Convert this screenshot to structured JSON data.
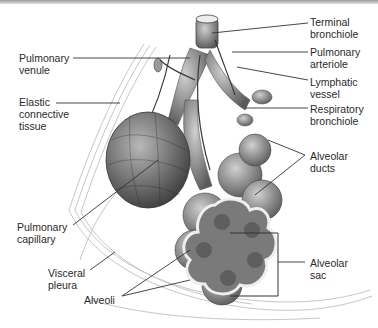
{
  "diagram": {
    "labels": [
      {
        "id": "terminal_bronchiole",
        "text": "Terminal\nbronchiole",
        "side": "right"
      },
      {
        "id": "pulmonary_arteriole",
        "text": "Pulmonary\narteriole",
        "side": "right"
      },
      {
        "id": "lymphatic_vessel",
        "text": "Lymphatic\nvessel",
        "side": "right"
      },
      {
        "id": "respiratory_bronchiole",
        "text": "Respiratory\nbronchiole",
        "side": "right"
      },
      {
        "id": "alveolar_ducts",
        "text": "Alveolar\nducts",
        "side": "right"
      },
      {
        "id": "alveolar_sac",
        "text": "Alveolar\nsac",
        "side": "right"
      },
      {
        "id": "pulmonary_venule",
        "text": "Pulmonary\nvenule",
        "side": "left"
      },
      {
        "id": "elastic_connective_tissue",
        "text": "Elastic\nconnective\ntissue",
        "side": "left"
      },
      {
        "id": "pulmonary_capillary",
        "text": "Pulmonary\ncapillary",
        "side": "left"
      },
      {
        "id": "visceral_pleura",
        "text": "Visceral\npleura",
        "side": "left"
      },
      {
        "id": "alveoli",
        "text": "Alveoli",
        "side": "bottom"
      }
    ],
    "colors": {
      "line": "#333333",
      "tissue": "#8a8a8a",
      "pleura": "#c8c8c8"
    }
  }
}
